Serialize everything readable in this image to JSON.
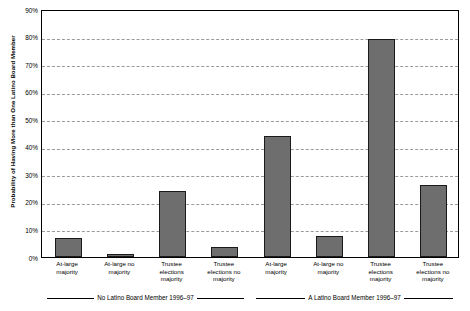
{
  "chart_data": {
    "type": "bar",
    "title": "",
    "subtitle": "",
    "xlabel": "",
    "ylabel": "Probability of Having More than One Latino Board Member",
    "ylim": [
      0,
      90
    ],
    "ytick_values": [
      0,
      10,
      20,
      30,
      40,
      50,
      60,
      70,
      80,
      90
    ],
    "ytick_labels": [
      "0%",
      "10%",
      "20%",
      "30%",
      "40%",
      "50%",
      "60%",
      "70%",
      "80%",
      "90%"
    ],
    "grid": true,
    "legend": "none",
    "bar_color": "#6e6e6e",
    "bar_edge_color": "#1a1a1a",
    "categories": [
      "At-large\nmajority",
      "At-large no\nmajority",
      "Trustee\nelections\nmajority",
      "Trustee\nelections no\nmajority",
      "At-large\nmajority",
      "At-large no\nmajority",
      "Trustee\nelections\nmajority",
      "Trustee\nelections no\nmajority"
    ],
    "values": [
      7,
      1,
      24,
      3.5,
      44,
      7.5,
      79,
      26
    ],
    "groups": [
      {
        "label": "No Latino Board Member 1996–97",
        "start_index": 0,
        "end_index": 3
      },
      {
        "label": "A Latino Board Member 1996–97",
        "start_index": 4,
        "end_index": 7
      }
    ]
  }
}
